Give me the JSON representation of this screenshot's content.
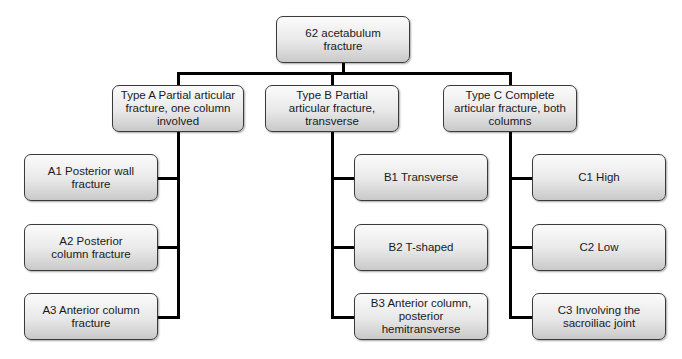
{
  "diagram": {
    "root": {
      "label": "62 acetabulum\nfracture"
    },
    "types": [
      {
        "label": "Type A Partial articular fracture, one column involved",
        "children": [
          {
            "label": "A1 Posterior wall fracture"
          },
          {
            "label": "A2 Posterior column fracture"
          },
          {
            "label": "A3 Anterior column fracture"
          }
        ]
      },
      {
        "label": "Type B Partial articular fracture, transverse",
        "children": [
          {
            "label": "B1 Transverse"
          },
          {
            "label": "B2 T-shaped"
          },
          {
            "label": "B3 Anterior column, posterior hemitransverse"
          }
        ]
      },
      {
        "label": "Type C Complete articular fracture, both columns",
        "children": [
          {
            "label": "C1 High"
          },
          {
            "label": "C2 Low"
          },
          {
            "label": "C3 Involving the sacroiliac joint"
          }
        ]
      }
    ]
  }
}
